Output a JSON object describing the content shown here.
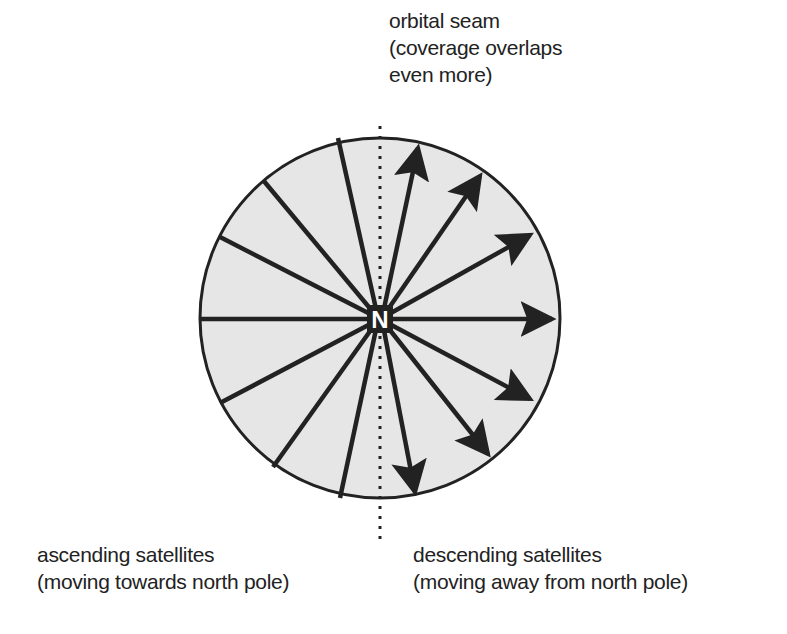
{
  "labels": {
    "seam": {
      "line1": "orbital seam",
      "line2": "(coverage overlaps",
      "line3": "even more)"
    },
    "ascending": {
      "line1": "ascending satellites",
      "line2": "(moving towards north pole)"
    },
    "descending": {
      "line1": "descending satellites",
      "line2": "(moving away from north pole)"
    },
    "center": "N"
  },
  "colors": {
    "disc_fill": "#e6e6e6",
    "stroke": "#222222",
    "background": "#ffffff"
  }
}
